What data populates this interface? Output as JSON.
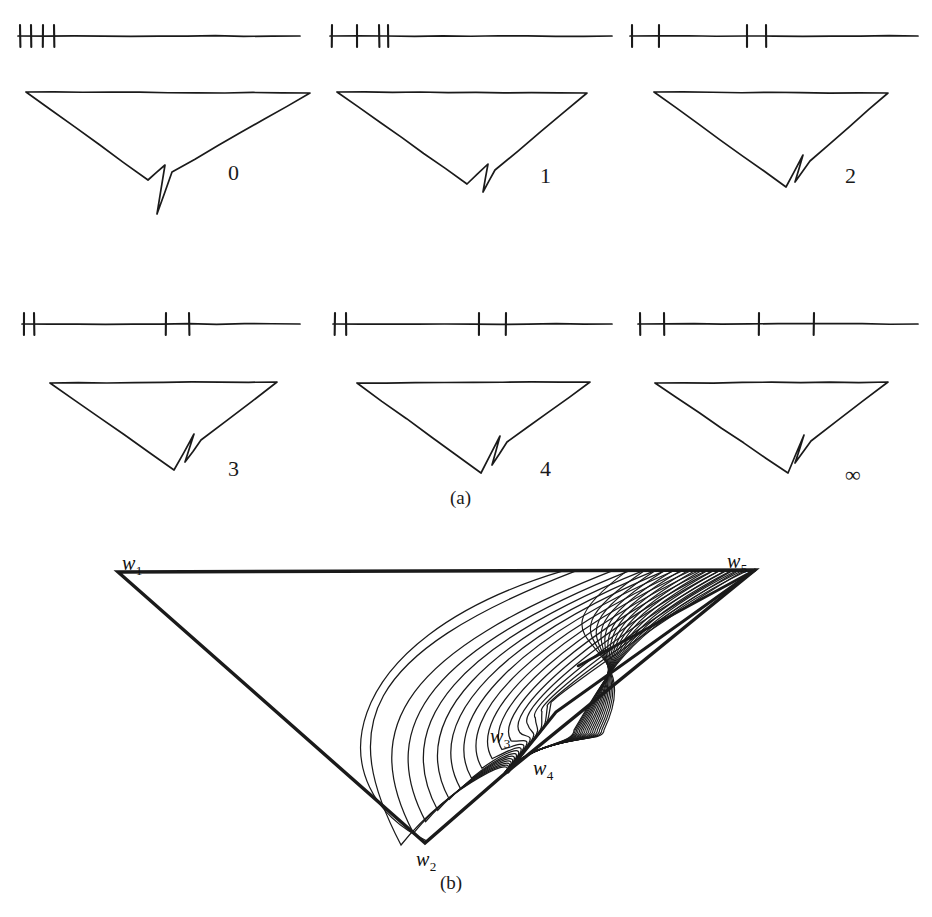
{
  "figure": {
    "type": "mathematical-diagram",
    "background": "#ffffff",
    "ink_color": "#1a1a1a",
    "caption_a": "(a)",
    "caption_b": "(b)",
    "partial_caption": ""
  },
  "panels": [
    {
      "id": "panel-0",
      "label": "0",
      "label_x": 228,
      "label_y": 160,
      "axis": {
        "y": 36,
        "x_start": 18,
        "x_end": 300,
        "tick_half_height": 11,
        "ticks": [
          20,
          31,
          43,
          54
        ]
      },
      "polygon": {
        "w1": [
          26,
          92
        ],
        "w5": [
          310,
          93
        ],
        "w2": [
          148,
          180
        ],
        "slit_tip": [
          157,
          214
        ],
        "slit_left_top": [
          165,
          165
        ],
        "slit_right_top": [
          172,
          172
        ]
      }
    },
    {
      "id": "panel-1",
      "label": "1",
      "label_x": 540,
      "label_y": 163,
      "axis": {
        "y": 36,
        "x_start": 330,
        "x_end": 612,
        "tick_half_height": 11,
        "ticks": [
          332,
          357,
          379,
          388
        ]
      },
      "polygon": {
        "w1": [
          337,
          92
        ],
        "w5": [
          587,
          93
        ],
        "w2": [
          467,
          184
        ],
        "slit_tip": [
          483,
          192
        ],
        "slit_left_top": [
          488,
          164
        ],
        "slit_right_top": [
          495,
          170
        ]
      }
    },
    {
      "id": "panel-2",
      "label": "2",
      "label_x": 845,
      "label_y": 163,
      "axis": {
        "y": 36,
        "x_start": 630,
        "x_end": 918,
        "tick_half_height": 11,
        "ticks": [
          632,
          659,
          747,
          766
        ]
      },
      "polygon": {
        "w1": [
          654,
          92
        ],
        "w5": [
          888,
          93
        ],
        "w2": [
          786,
          187
        ],
        "slit_tip": [
          795,
          182
        ],
        "slit_left_top": [
          803,
          155
        ],
        "slit_right_top": [
          810,
          161
        ]
      }
    },
    {
      "id": "panel-3",
      "label": "3",
      "label_x": 228,
      "label_y": 456,
      "axis": {
        "y": 324,
        "x_start": 22,
        "x_end": 300,
        "tick_half_height": 11,
        "ticks": [
          24,
          34,
          166,
          189
        ]
      },
      "polygon": {
        "w1": [
          50,
          383
        ],
        "w5": [
          277,
          382
        ],
        "w2": [
          174,
          470
        ],
        "slit_tip": [
          185,
          462
        ],
        "slit_left_top": [
          194,
          434
        ],
        "slit_right_top": [
          201,
          440
        ]
      }
    },
    {
      "id": "panel-4",
      "label": "4",
      "label_x": 540,
      "label_y": 456,
      "axis": {
        "y": 324,
        "x_start": 333,
        "x_end": 612,
        "tick_half_height": 11,
        "ticks": [
          335,
          346,
          479,
          506
        ]
      },
      "polygon": {
        "w1": [
          357,
          383
        ],
        "w5": [
          590,
          382
        ],
        "w2": [
          481,
          473
        ],
        "slit_tip": [
          492,
          465
        ],
        "slit_left_top": [
          500,
          436
        ],
        "slit_right_top": [
          507,
          442
        ]
      }
    },
    {
      "id": "panel-5",
      "label": "∞",
      "label_x": 845,
      "label_y": 462,
      "axis": {
        "y": 324,
        "x_start": 638,
        "x_end": 918,
        "tick_half_height": 11,
        "ticks": [
          640,
          664,
          759,
          814
        ]
      },
      "polygon": {
        "w1": [
          655,
          383
        ],
        "w5": [
          888,
          382
        ],
        "w2": [
          788,
          473
        ],
        "slit_tip": [
          795,
          463
        ],
        "slit_left_top": [
          804,
          435
        ],
        "slit_right_top": [
          811,
          441
        ]
      }
    }
  ],
  "figure_b": {
    "vertices": {
      "w1": [
        118,
        572
      ],
      "w5": [
        755,
        570
      ],
      "w2": [
        425,
        843
      ],
      "w3": [
        552,
        720
      ],
      "w4": [
        502,
        776
      ]
    },
    "labels": [
      {
        "name": "w1",
        "text": "w",
        "sub": "1",
        "x": 122,
        "y": 552
      },
      {
        "name": "w5",
        "text": "w",
        "sub": "5",
        "x": 727,
        "y": 550
      },
      {
        "name": "w2",
        "text": "w",
        "sub": "2",
        "x": 416,
        "y": 848
      },
      {
        "name": "w3",
        "text": "w",
        "sub": "3",
        "x": 490,
        "y": 725
      },
      {
        "name": "w4",
        "text": "w",
        "sub": "4",
        "x": 533,
        "y": 757
      }
    ],
    "curve_family_count": 17,
    "description": "Conformal map image: triangle with slit and a family of streamline arcs running from the top edge to the slit tip"
  }
}
